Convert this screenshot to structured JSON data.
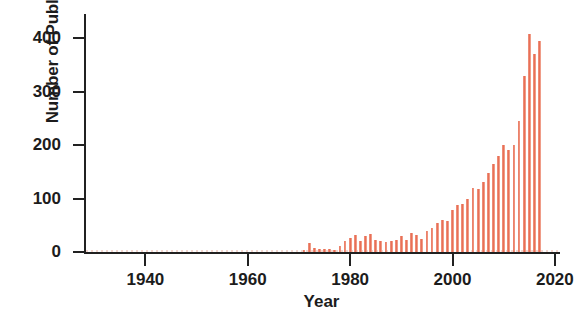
{
  "chart_data": {
    "type": "bar",
    "title": "",
    "subtitle": "",
    "xlabel": "Year",
    "ylabel": "Number of Publications",
    "xlim": [
      1928,
      2021
    ],
    "ylim": [
      0,
      445
    ],
    "grid": false,
    "legend": null,
    "bar_color": "#ea7059",
    "axis_color": "#212121",
    "xticks": [
      1940,
      1960,
      1980,
      2000,
      2020
    ],
    "yticks": [
      0,
      100,
      200,
      300,
      400
    ],
    "xtick_labels": [
      "1940",
      "1960",
      "1980",
      "2000",
      "2020"
    ],
    "ytick_labels": [
      "0",
      "100",
      "200",
      "300",
      "400"
    ],
    "x": [
      1971,
      1972,
      1973,
      1974,
      1975,
      1976,
      1977,
      1978,
      1979,
      1980,
      1981,
      1982,
      1983,
      1984,
      1985,
      1986,
      1987,
      1988,
      1989,
      1990,
      1991,
      1992,
      1993,
      1994,
      1995,
      1996,
      1997,
      1998,
      1999,
      2000,
      2001,
      2002,
      2003,
      2004,
      2005,
      2006,
      2007,
      2008,
      2009,
      2010,
      2011,
      2012,
      2013,
      2014,
      2015,
      2016,
      2017
    ],
    "values": [
      3,
      16,
      8,
      5,
      6,
      5,
      4,
      12,
      20,
      26,
      32,
      20,
      30,
      34,
      22,
      20,
      18,
      20,
      22,
      30,
      23,
      36,
      32,
      24,
      40,
      45,
      55,
      60,
      58,
      78,
      88,
      90,
      100,
      120,
      118,
      130,
      148,
      165,
      180,
      200,
      190,
      200,
      245,
      330,
      408,
      370,
      395
    ],
    "categories": [
      "1971",
      "1972",
      "1973",
      "1974",
      "1975",
      "1976",
      "1977",
      "1978",
      "1979",
      "1980",
      "1981",
      "1982",
      "1983",
      "1984",
      "1985",
      "1986",
      "1987",
      "1988",
      "1989",
      "1990",
      "1991",
      "1992",
      "1993",
      "1994",
      "1995",
      "1996",
      "1997",
      "1998",
      "1999",
      "2000",
      "2001",
      "2002",
      "2003",
      "2004",
      "2005",
      "2006",
      "2007",
      "2008",
      "2009",
      "2010",
      "2011",
      "2012",
      "2013",
      "2014",
      "2015",
      "2016",
      "2017"
    ]
  }
}
